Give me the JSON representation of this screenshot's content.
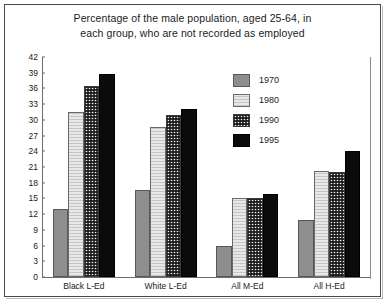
{
  "chart_data": {
    "type": "bar",
    "title": "Percentage of the male population, aged 25-64, in each group, who are not recorded as employed",
    "title_lines": [
      "Percentage of the male population, aged 25-64, in",
      "each group, who are not recorded as employed"
    ],
    "xlabel": "",
    "ylabel": "",
    "ylim": [
      0,
      42
    ],
    "ytick_step": 3,
    "yticks": [
      0,
      3,
      6,
      9,
      12,
      15,
      18,
      21,
      24,
      27,
      30,
      33,
      36,
      39,
      42
    ],
    "grid": false,
    "legend_position": "top-right-inside",
    "categories": [
      "Black L-Ed",
      "White L-Ed",
      "All M-Ed",
      "All H-Ed"
    ],
    "series": [
      {
        "name": "1970",
        "color": "#8e8e8e",
        "values": [
          13.0,
          16.7,
          6.0,
          10.8
        ]
      },
      {
        "name": "1980",
        "color": "#e8e8e8",
        "values": [
          31.5,
          28.7,
          15.0,
          20.3
        ]
      },
      {
        "name": "1990",
        "color": "#f2f2f2",
        "values": [
          36.5,
          31.0,
          15.0,
          20.0
        ]
      },
      {
        "name": "1995",
        "color": "#0b0b0b",
        "values": [
          38.7,
          32.0,
          15.8,
          24.0
        ]
      }
    ]
  }
}
